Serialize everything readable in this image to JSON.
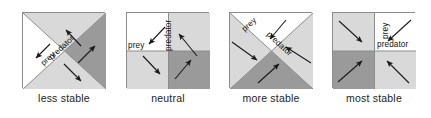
{
  "figure": {
    "title": "",
    "panel_count": 4,
    "colors": {
      "white": "#ffffff",
      "light_gray": "#d9d9d9",
      "dark_gray": "#9a9a9a",
      "border": "#8d8d8d",
      "arrow": "#1a1a1a",
      "text": "#1c1c1c"
    },
    "labels": {
      "prey": "prey",
      "predator": "predator"
    }
  },
  "panels": [
    {
      "id": "less-stable",
      "caption": "less stable",
      "divider": "diagonal",
      "regions": {
        "top": "light_gray",
        "left": "white",
        "right": "dark_gray",
        "bottom": "light_gray"
      },
      "labels": [
        {
          "text": "prey",
          "placement": "anti-diagonal-lower-left"
        },
        {
          "text": "predator",
          "placement": "anti-diagonal-upper-right"
        }
      ],
      "arrows": [
        {
          "from": "center-upper-right",
          "to": "upper-left",
          "direction": "up-left"
        },
        {
          "from": "center-left",
          "to": "lower-left",
          "direction": "down-left"
        },
        {
          "from": "center-lower-left",
          "to": "lower-right",
          "direction": "down-right"
        },
        {
          "from": "center-right",
          "to": "upper-right",
          "direction": "up-right"
        }
      ]
    },
    {
      "id": "neutral",
      "caption": "neutral",
      "divider": "cross",
      "regions": {
        "top_left": "white",
        "top_right": "light_gray",
        "bottom_left": "light_gray",
        "bottom_right": "dark_gray"
      },
      "labels": [
        {
          "text": "prey",
          "placement": "horizontal-left"
        },
        {
          "text": "predator",
          "placement": "vertical-rotated"
        }
      ],
      "arrows": [
        {
          "quadrant": "top_right",
          "direction": "up-left"
        },
        {
          "quadrant": "top_left",
          "direction": "down-left"
        },
        {
          "quadrant": "bottom_left",
          "direction": "down-right"
        },
        {
          "quadrant": "bottom_right",
          "direction": "up-right"
        }
      ]
    },
    {
      "id": "more-stable",
      "caption": "more stable",
      "divider": "diagonal",
      "regions": {
        "top": "white",
        "left": "light_gray",
        "right": "light_gray",
        "bottom": "dark_gray"
      },
      "labels": [
        {
          "text": "prey",
          "placement": "anti-diagonal-upper-left"
        },
        {
          "text": "predator",
          "placement": "main-diagonal-upper-right"
        }
      ],
      "arrows": [
        {
          "from": "top",
          "to": "center",
          "direction": "down-left-inward"
        },
        {
          "from": "left",
          "to": "center",
          "direction": "down-right-inward"
        },
        {
          "from": "right",
          "to": "center",
          "direction": "up-left-inward"
        },
        {
          "from": "bottom",
          "to": "center",
          "direction": "up-right-inward"
        }
      ]
    },
    {
      "id": "most-stable",
      "caption": "most stable",
      "divider": "cross",
      "regions": {
        "top_left": "light_gray",
        "top_right": "white",
        "bottom_left": "dark_gray",
        "bottom_right": "light_gray"
      },
      "labels": [
        {
          "text": "prey",
          "placement": "vertical-rotated"
        },
        {
          "text": "predator",
          "placement": "horizontal"
        }
      ],
      "arrows": [
        {
          "quadrant": "top_left",
          "direction": "down-right-inward"
        },
        {
          "quadrant": "top_right",
          "direction": "down-left-inward"
        },
        {
          "quadrant": "bottom_left",
          "direction": "up-right-inward"
        },
        {
          "quadrant": "bottom_right",
          "direction": "up-left-inward"
        }
      ]
    }
  ]
}
